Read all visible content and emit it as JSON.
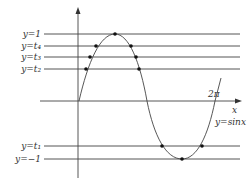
{
  "diagram": {
    "curve_label": "y=sinx",
    "x_axis_label": "x",
    "period_label": "2π",
    "lines": [
      {
        "label": "y=1",
        "y": 34
      },
      {
        "label": "y=t₄",
        "y": 46
      },
      {
        "label": "y=t₃",
        "y": 57
      },
      {
        "label": "y=t₂",
        "y": 69
      },
      {
        "label": "y=t₁",
        "y": 146
      },
      {
        "label": "y=−1",
        "y": 159
      }
    ],
    "points": [
      [
        115,
        34
      ],
      [
        96,
        46
      ],
      [
        131,
        46
      ],
      [
        90,
        57
      ],
      [
        136,
        57
      ],
      [
        86,
        69
      ],
      [
        139,
        69
      ],
      [
        162,
        146
      ],
      [
        202,
        146
      ],
      [
        182,
        159
      ]
    ],
    "colors": {
      "line": "#555555",
      "curve": "#444444",
      "point": "#111111"
    }
  }
}
